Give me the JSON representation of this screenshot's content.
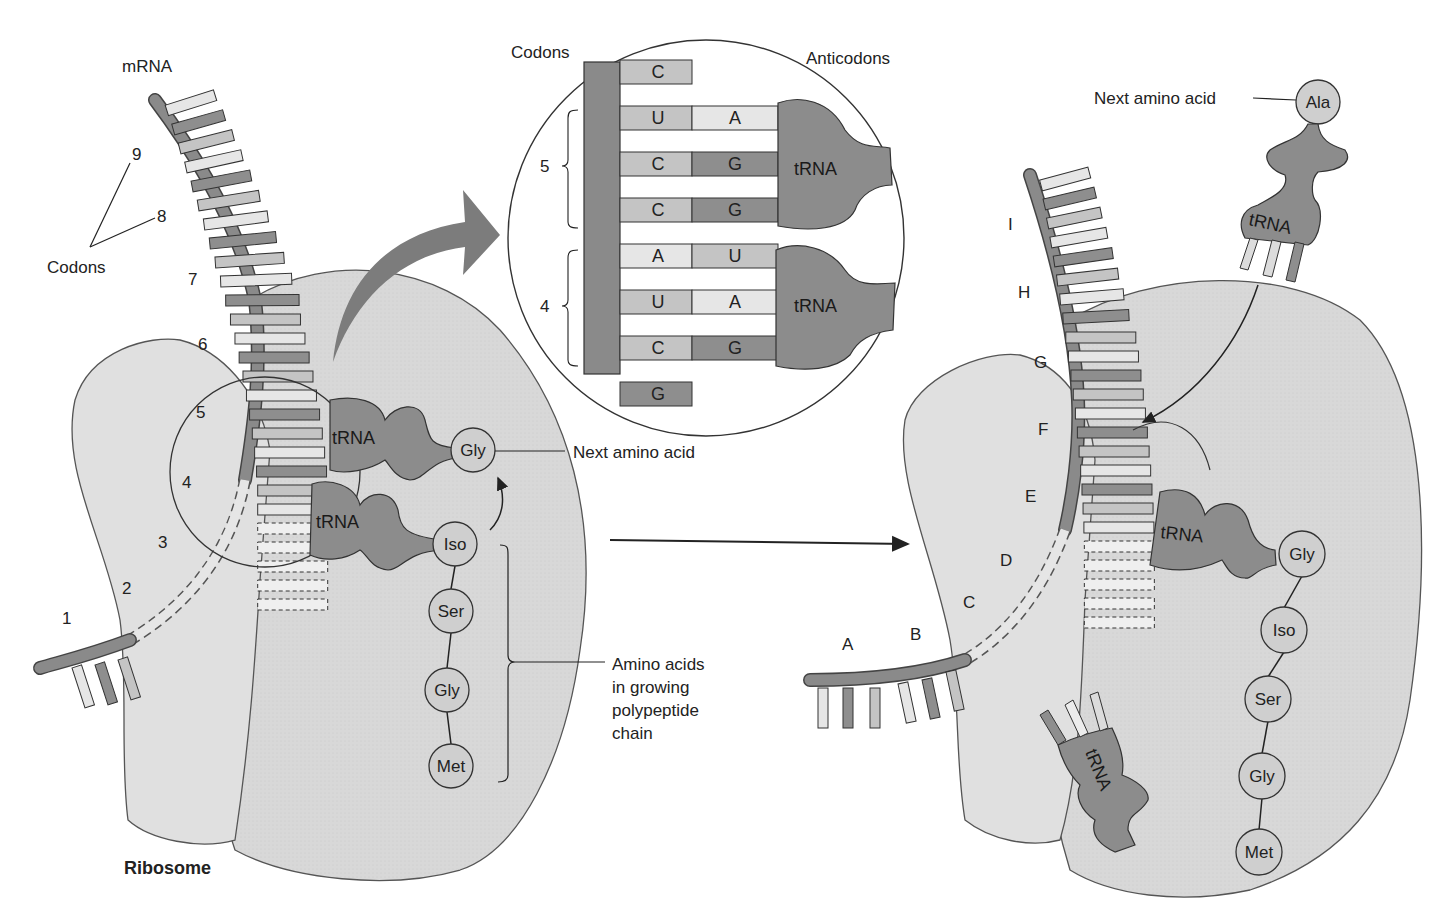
{
  "figure": {
    "colors": {
      "ribosome": "#d9d9d9",
      "ribosome_outline": "#555555",
      "mrna_strand": "#8a8a8a",
      "trna": "#8c8c8c",
      "amino_acid": "#cfcfcf",
      "base_light": "#e6e6e6",
      "base_mid": "#c4c4c4",
      "base_dark": "#8e8e8e",
      "arrow": "#7a7a7a"
    }
  },
  "left_panel": {
    "mrna_label": "mRNA",
    "codons_label": "Codons",
    "ribosome_label": "Ribosome",
    "codon_numbers": [
      "9",
      "8",
      "7",
      "6",
      "5",
      "4",
      "3",
      "2",
      "1"
    ],
    "trna_labels": [
      "tRNA",
      "tRNA"
    ],
    "next_amino_acid": {
      "residue": "Gly",
      "label": "Next amino acid"
    },
    "polypeptide": [
      "Iso",
      "Ser",
      "Gly",
      "Met"
    ],
    "polypeptide_label": [
      "Amino acids",
      "in growing",
      "polypeptide",
      "chain"
    ]
  },
  "inset": {
    "codons_header": "Codons",
    "anticodons_header": "Anticodons",
    "codon_groups": [
      {
        "number": "5",
        "pairs": [
          {
            "codon": "U",
            "anticodon": "A"
          },
          {
            "codon": "C",
            "anticodon": "G"
          },
          {
            "codon": "C",
            "anticodon": "G"
          }
        ],
        "trna_label": "tRNA"
      },
      {
        "number": "4",
        "pairs": [
          {
            "codon": "A",
            "anticodon": "U"
          },
          {
            "codon": "U",
            "anticodon": "A"
          },
          {
            "codon": "C",
            "anticodon": "G"
          }
        ],
        "trna_label": "tRNA"
      }
    ],
    "unpaired_top": "C",
    "unpaired_bottom": "G"
  },
  "right_panel": {
    "codon_letters": [
      "I",
      "H",
      "G",
      "F",
      "E",
      "D",
      "C",
      "B",
      "A"
    ],
    "next_amino_acid": {
      "residue": "Ala",
      "label": "Next amino acid"
    },
    "incoming_trna_label": "tRNA",
    "bound_trna_label": "tRNA",
    "released_trna_label": "tRNA",
    "polypeptide": [
      "Gly",
      "Iso",
      "Ser",
      "Gly",
      "Met"
    ]
  }
}
